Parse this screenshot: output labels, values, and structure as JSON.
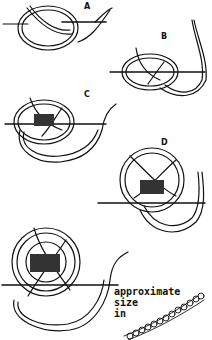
{
  "figure": {
    "stages": [
      {
        "label": "A"
      },
      {
        "label": "B"
      },
      {
        "label": "C"
      },
      {
        "label": "D"
      },
      {
        "label": ""
      }
    ],
    "caption": {
      "line1": "approximate",
      "line2": "size",
      "line3": "in"
    },
    "colors": {
      "ink": "#111111",
      "paper": "#ffffff"
    }
  }
}
